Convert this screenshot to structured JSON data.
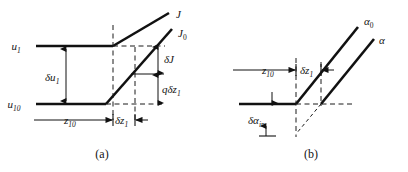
{
  "figure": {
    "background_color": "#ffffff",
    "ink_color": "#111111",
    "panels": [
      {
        "id": "a",
        "caption": "(a)",
        "curve_labels": [
          {
            "name": "J-label",
            "base": "J",
            "sub": ""
          },
          {
            "name": "J0-label",
            "base": "J",
            "sub": "0"
          }
        ],
        "axis_labels": [
          {
            "name": "u1-label",
            "base": "u",
            "sub": "1"
          },
          {
            "name": "u10-label",
            "base": "u",
            "sub": "10"
          }
        ],
        "dimension_labels": [
          {
            "name": "delta-u1",
            "base": "δu",
            "sub": "1"
          },
          {
            "name": "delta-J",
            "base": "δJ",
            "sub": ""
          },
          {
            "name": "q-delta-z1",
            "base": "qδz",
            "sub": "1"
          },
          {
            "name": "z10",
            "base": "z",
            "sub": "10"
          },
          {
            "name": "delta-z1",
            "base": "δz",
            "sub": "1"
          }
        ]
      },
      {
        "id": "b",
        "caption": "(b)",
        "curve_labels": [
          {
            "name": "alpha0-label",
            "base": "α",
            "sub": "0"
          },
          {
            "name": "alpha-label",
            "base": "α",
            "sub": ""
          }
        ],
        "axis_labels": [],
        "dimension_labels": [
          {
            "name": "z10",
            "base": "z",
            "sub": "10"
          },
          {
            "name": "delta-z1",
            "base": "δz",
            "sub": "1"
          },
          {
            "name": "delta-alpha-in",
            "base": "δα",
            "sub": "in"
          }
        ]
      }
    ]
  }
}
